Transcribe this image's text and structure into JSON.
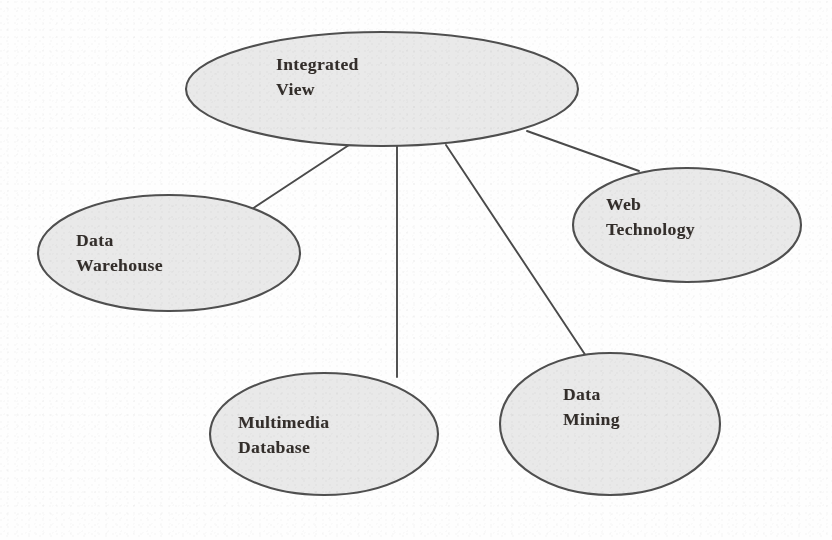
{
  "diagram": {
    "background_color": "#fefefe",
    "node_fill_color": "#e9e9e9",
    "node_stroke_color": "#4f4f4f",
    "edge_stroke_color": "#4a4a4a",
    "text_color": "#332e2b",
    "nodes": [
      {
        "id": "integrated-view",
        "label_line1": "Integrated",
        "label_line2": "View",
        "cx": 382,
        "cy": 89,
        "rx": 196,
        "ry": 57,
        "text_x": 276,
        "text_y": 52
      },
      {
        "id": "data-warehouse",
        "label_line1": "Data",
        "label_line2": "Warehouse",
        "cx": 169,
        "cy": 253,
        "rx": 131,
        "ry": 58,
        "text_x": 76,
        "text_y": 228
      },
      {
        "id": "web-technology",
        "label_line1": "Web",
        "label_line2": "Technology",
        "cx": 687,
        "cy": 225,
        "rx": 114,
        "ry": 57,
        "text_x": 606,
        "text_y": 192
      },
      {
        "id": "multimedia-database",
        "label_line1": "Multimedia",
        "label_line2": "Database",
        "cx": 324,
        "cy": 434,
        "rx": 114,
        "ry": 61,
        "text_x": 238,
        "text_y": 410
      },
      {
        "id": "data-mining",
        "label_line1": "Data",
        "label_line2": "Mining",
        "cx": 610,
        "cy": 424,
        "rx": 110,
        "ry": 71,
        "text_x": 563,
        "text_y": 382
      }
    ],
    "edges": [
      {
        "id": "edge-integrated-view-to-data-warehouse",
        "from": "integrated-view",
        "to": "data-warehouse",
        "x1": 349,
        "y1": 145,
        "x2": 252,
        "y2": 209
      },
      {
        "id": "edge-integrated-view-to-multimedia-database",
        "from": "integrated-view",
        "to": "multimedia-database",
        "x1": 397,
        "y1": 146,
        "x2": 397,
        "y2": 377
      },
      {
        "id": "edge-integrated-view-to-data-mining",
        "from": "integrated-view",
        "to": "data-mining",
        "x1": 446,
        "y1": 145,
        "x2": 586,
        "y2": 356
      },
      {
        "id": "edge-integrated-view-to-web-technology",
        "from": "integrated-view",
        "to": "web-technology",
        "x1": 527,
        "y1": 131,
        "x2": 639,
        "y2": 171
      }
    ]
  }
}
